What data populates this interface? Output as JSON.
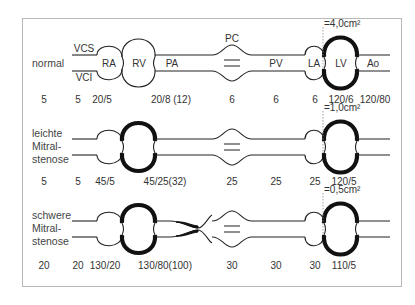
{
  "diagram": {
    "type": "hemodynamic circulation diagram",
    "rows": [
      {
        "id": "normal",
        "label_lines": [
          "normal"
        ],
        "valve_area": "=4,0cm²",
        "vessel_labels": {
          "vcs": "VCS",
          "vci": "VCI",
          "ra": "RA",
          "rv": "RV",
          "pa": "PA",
          "pc": "PC",
          "pv": "PV",
          "la": "LA",
          "lv": "LV",
          "ao": "Ao"
        },
        "pressures": [
          "5",
          "5",
          "20/5",
          "20/8 (12)",
          "6",
          "6",
          "6",
          "120/6",
          "120/80"
        ],
        "rv_hypertrophy": false,
        "pa_narrowing": false
      },
      {
        "id": "leichte",
        "label_lines": [
          "leichte",
          "Mitral-",
          "stenose"
        ],
        "valve_area": "=1,0cm²",
        "pressures": [
          "5",
          "5",
          "45/5",
          "45/25(32)",
          "25",
          "25",
          "25",
          "120/5"
        ],
        "rv_hypertrophy": true,
        "pa_narrowing": false
      },
      {
        "id": "schwere",
        "label_lines": [
          "schwere",
          "Mitral-",
          "stenose"
        ],
        "valve_area": "=0,5cm²",
        "pressures": [
          "20",
          "20",
          "130/20",
          "130/80(100)",
          "30",
          "30",
          "30",
          "110/5"
        ],
        "rv_hypertrophy": true,
        "pa_narrowing": true
      }
    ]
  }
}
